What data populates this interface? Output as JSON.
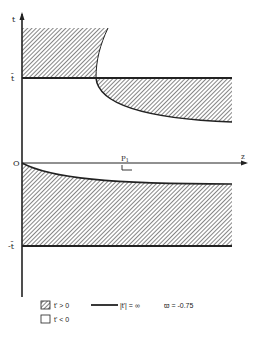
{
  "diagram": {
    "axes": {
      "vertical_label": "t",
      "horizontal_label": "z",
      "origin_label": "O",
      "tbar_label": "t̄",
      "neg_tbar_label": "-t̄",
      "point_label": "P",
      "point_subscript": "1"
    },
    "legend": {
      "hatched_label": "t' > 0",
      "empty_label": "t' < 0",
      "line_label": "|t'| = ∞",
      "param_label": "ϖ = -0.75"
    },
    "colors": {
      "ink": "#222222",
      "hatch": "#555555",
      "background": "#ffffff"
    }
  }
}
